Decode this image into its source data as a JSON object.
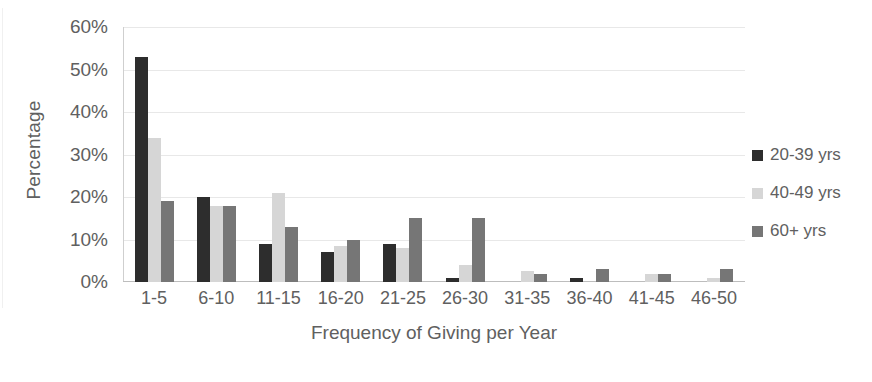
{
  "chart_data": {
    "type": "bar",
    "title": "",
    "subtitle": "",
    "xlabel": "Frequency of Giving per Year",
    "ylabel": "Percentage",
    "categories": [
      "1-5",
      "6-10",
      "11-15",
      "16-20",
      "21-25",
      "26-30",
      "31-35",
      "36-40",
      "41-45",
      "46-50"
    ],
    "series": [
      {
        "name": "20-39 yrs",
        "color": "#2d2d2d",
        "values": [
          53,
          20,
          9,
          7,
          9,
          1,
          0,
          1,
          0,
          0
        ]
      },
      {
        "name": "40-49 yrs",
        "color": "#d6d6d6",
        "values": [
          34,
          18,
          21,
          8.5,
          8,
          4,
          2.5,
          0,
          2,
          1
        ]
      },
      {
        "name": "60+ yrs",
        "color": "#767676",
        "values": [
          19,
          18,
          13,
          10,
          15,
          15,
          2,
          3,
          2,
          3
        ]
      }
    ],
    "ylim": [
      0,
      60
    ],
    "ytick_values": [
      0,
      10,
      20,
      30,
      40,
      50,
      60
    ],
    "ytick_labels": [
      "0%",
      "10%",
      "20%",
      "30%",
      "40%",
      "50%",
      "60%"
    ],
    "grid": true,
    "grid_axis": "y",
    "legend_position": "right",
    "bar_orientation": "vertical",
    "grouped": true
  },
  "axes": {
    "y_title": "Percentage",
    "x_title": "Frequency of Giving per Year"
  },
  "legend": {
    "items": [
      {
        "label": "20-39 yrs",
        "color": "#2d2d2d"
      },
      {
        "label": "40-49 yrs",
        "color": "#d6d6d6"
      },
      {
        "label": "60+ yrs",
        "color": "#767676"
      }
    ]
  }
}
